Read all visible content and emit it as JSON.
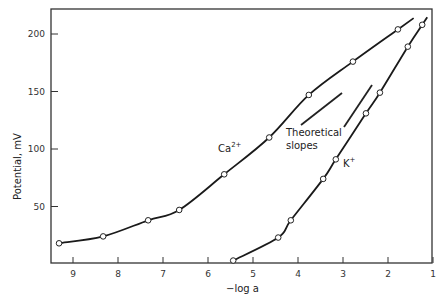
{
  "chart_data": {
    "type": "line",
    "title": "",
    "xlabel": "−log a",
    "ylabel": "Potential,  mV",
    "xlim": [
      9.5,
      1
    ],
    "ylim": [
      0,
      220
    ],
    "x_reversed": true,
    "grid": false,
    "x_ticks": [
      "9",
      "8",
      "7",
      "6",
      "5",
      "4",
      "3",
      "2",
      "1"
    ],
    "y_ticks": [
      "50",
      "100",
      "150",
      "200"
    ],
    "series": [
      {
        "name": "Ca2+",
        "label": "Ca",
        "superscript": "2+",
        "x": [
          9.31,
          8.33,
          7.33,
          6.64,
          5.64,
          4.64,
          3.76,
          2.78,
          1.78
        ],
        "y": [
          18,
          24,
          38,
          47,
          78,
          110,
          147,
          176,
          204
        ]
      },
      {
        "name": "K+",
        "label": "K",
        "superscript": "+",
        "x": [
          5.44,
          4.44,
          4.16,
          3.44,
          3.16,
          2.49,
          2.18,
          1.56,
          1.24
        ],
        "y": [
          3,
          23,
          38,
          74,
          91,
          131,
          149,
          189,
          208
        ]
      }
    ],
    "annotations": [
      {
        "text": "Theoretical",
        "line2": "slopes"
      }
    ]
  }
}
